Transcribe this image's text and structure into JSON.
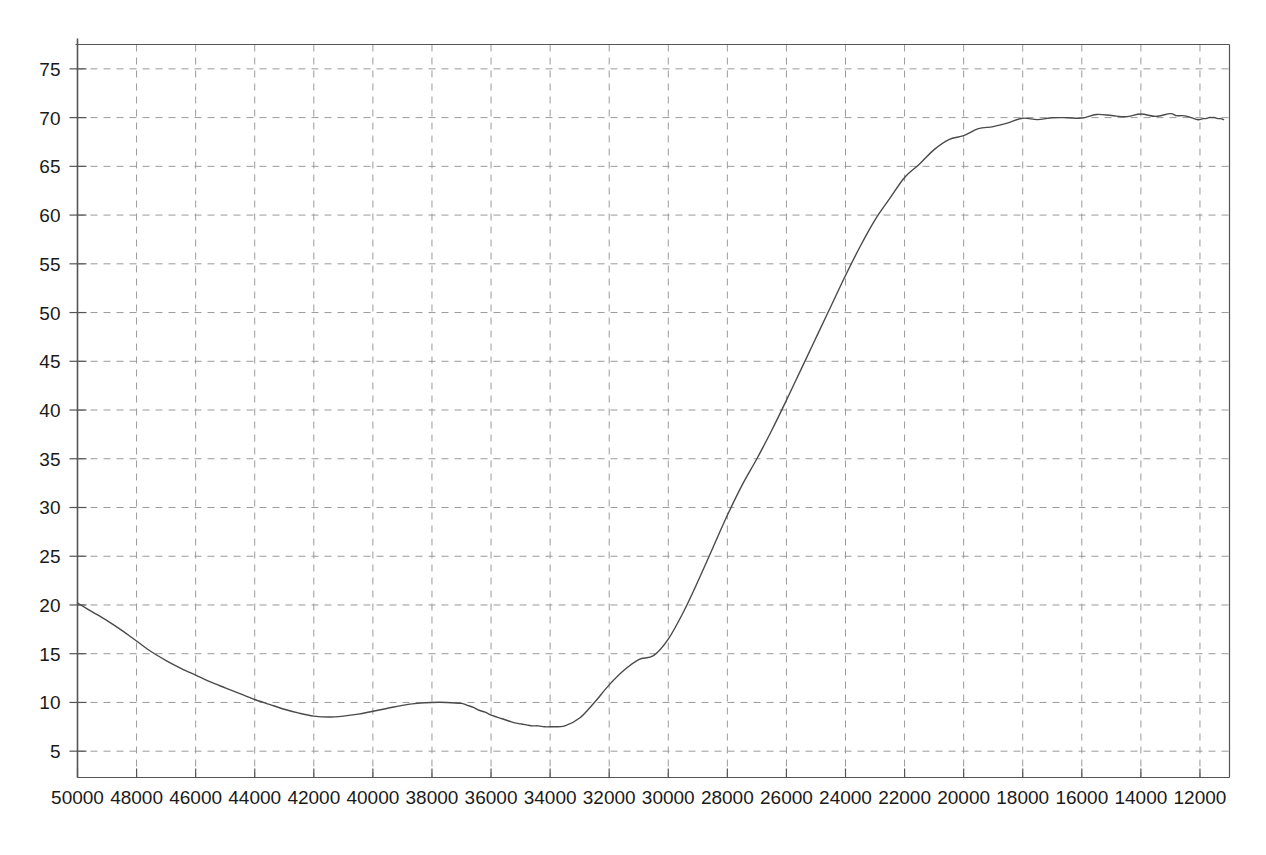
{
  "chart_data": {
    "type": "line",
    "title": "",
    "subtitle": "",
    "xlabel": "",
    "ylabel": "",
    "xlim": [
      50000,
      11000
    ],
    "ylim": [
      2.3,
      77.5
    ],
    "x_axis_reversed": true,
    "grid": true,
    "legend": "none",
    "x_ticks": [
      50000,
      48000,
      46000,
      44000,
      42000,
      40000,
      38000,
      36000,
      34000,
      32000,
      30000,
      28000,
      26000,
      24000,
      22000,
      20000,
      18000,
      16000,
      14000,
      12000
    ],
    "x_tick_labels": [
      "50000",
      "48000",
      "46000",
      "44000",
      "42000",
      "40000",
      "38000",
      "36000",
      "34000",
      "32000",
      "30000",
      "28000",
      "26000",
      "24000",
      "22000",
      "20000",
      "18000",
      "16000",
      "14000",
      "12000"
    ],
    "y_ticks": [
      5,
      10,
      15,
      20,
      25,
      30,
      35,
      40,
      45,
      50,
      55,
      60,
      65,
      70,
      75
    ],
    "y_tick_labels": [
      "5",
      "10",
      "15",
      "20",
      "25",
      "30",
      "35",
      "40",
      "45",
      "50",
      "55",
      "60",
      "65",
      "70",
      "75"
    ],
    "line_color": "#4a4a4a",
    "grid_color": "#9a9a9a",
    "axis_color": "#555555",
    "background": "#ffffff",
    "series": [
      {
        "name": "spectrum",
        "x": [
          50000,
          49500,
          49000,
          48500,
          48000,
          47500,
          47000,
          46500,
          46000,
          45500,
          45000,
          44500,
          44000,
          43500,
          43000,
          42500,
          42000,
          41500,
          41000,
          40500,
          40000,
          39500,
          39000,
          38500,
          38000,
          37500,
          37000,
          36800,
          36600,
          36400,
          36200,
          36000,
          35800,
          35600,
          35400,
          35200,
          35000,
          34800,
          34600,
          34400,
          34200,
          34000,
          33500,
          33000,
          32500,
          32000,
          31500,
          31000,
          30500,
          30000,
          29500,
          29000,
          28500,
          28000,
          27500,
          27000,
          26500,
          26000,
          25500,
          25000,
          24500,
          24000,
          23500,
          23000,
          22500,
          22000,
          21500,
          21000,
          20500,
          20000,
          19500,
          19000,
          18500,
          18000,
          17500,
          17000,
          16500,
          16000,
          15500,
          15000,
          14500,
          14000,
          13500,
          13000,
          12800,
          12600,
          12400,
          12300,
          12200,
          12100,
          12000,
          11900,
          11800,
          11700,
          11600,
          11500,
          11400,
          11300,
          11200
        ],
        "y": [
          20.2,
          19.3,
          18.4,
          17.4,
          16.3,
          15.2,
          14.3,
          13.5,
          12.8,
          12.1,
          11.5,
          10.9,
          10.3,
          9.8,
          9.3,
          8.9,
          8.6,
          8.5,
          8.6,
          8.8,
          9.1,
          9.4,
          9.7,
          9.9,
          10.0,
          10.0,
          9.9,
          9.7,
          9.5,
          9.2,
          9.0,
          8.7,
          8.5,
          8.3,
          8.1,
          7.9,
          7.8,
          7.7,
          7.6,
          7.6,
          7.5,
          7.5,
          7.6,
          8.4,
          10.0,
          11.8,
          13.3,
          14.4,
          14.8,
          16.5,
          19.2,
          22.4,
          25.8,
          29.2,
          32.3,
          35.0,
          37.9,
          41.0,
          44.2,
          47.4,
          50.6,
          53.8,
          56.8,
          59.5,
          61.8,
          63.8,
          65.4,
          66.6,
          67.6,
          68.3,
          68.8,
          69.2,
          69.5,
          69.7,
          69.9,
          70.0,
          70.0,
          70.1,
          70.1,
          70.2,
          70.2,
          70.3,
          70.3,
          70.3,
          70.2,
          70.2,
          70.1,
          70.0,
          69.9,
          69.8,
          69.8,
          69.9,
          69.9,
          70.0,
          70.0,
          70.0,
          69.9,
          69.9,
          69.8
        ],
        "plateau_value": 70.0,
        "global_min": 7.5,
        "global_max": 70.3,
        "start_value": 20.2,
        "end_value": 69.0,
        "notes": [
          {
            "feature": "local-minimum",
            "x": 41500,
            "y": 8.5
          },
          {
            "feature": "local-maximum",
            "x": 38000,
            "y": 10.0
          },
          {
            "feature": "global-minimum",
            "x": 37000,
            "y": 7.5
          },
          {
            "feature": "inflection-knee",
            "x": 34800,
            "y": 14.7
          },
          {
            "feature": "steep-rise",
            "x_range": [
              34500,
              26000
            ]
          },
          {
            "feature": "plateau",
            "x_range": [
              22000,
              13000
            ],
            "y": 70.1
          },
          {
            "feature": "sharp-dip",
            "x": 12200,
            "y": 65.5
          },
          {
            "feature": "recovery",
            "x": 11500,
            "y": 69.1
          }
        ]
      }
    ]
  }
}
